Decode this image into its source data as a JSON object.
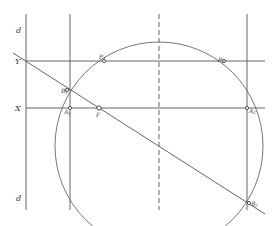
{
  "diagram": {
    "type": "geometric-construction",
    "labels": {
      "d_top": "d",
      "d_bottom": "d",
      "Y": "Y",
      "X": "X",
      "P1": "P",
      "P1_sub": "1",
      "P2": "P",
      "P2_sub": "2",
      "B1": "B",
      "B1_sub": "1",
      "A1": "A",
      "A1_sub": "1",
      "F": "F",
      "A2": "A",
      "A2_sub": "2",
      "B2": "B",
      "B2_sub": "2"
    },
    "elements": {
      "vertical_lines": [
        {
          "name": "d-line",
          "x": 26,
          "y1": 14,
          "y2": 210
        },
        {
          "name": "a1-line",
          "x": 70,
          "y1": 14,
          "y2": 210
        },
        {
          "name": "axis-dashed",
          "x": 159,
          "y1": 14,
          "y2": 210,
          "dashed": true
        },
        {
          "name": "a2-line",
          "x": 247,
          "y1": 14,
          "y2": 210
        }
      ],
      "horizontal_lines": [
        {
          "name": "y-line",
          "y": 61,
          "x1": 26,
          "x2": 265
        },
        {
          "name": "x-line",
          "y": 108,
          "x1": 26,
          "x2": 265
        }
      ],
      "diagonal": {
        "x1": 13,
        "y1": 53,
        "x2": 265,
        "y2": 214
      },
      "circle": {
        "cx": 159,
        "cy": 146,
        "r": 104
      },
      "points": [
        {
          "name": "P1",
          "x": 104,
          "y": 61
        },
        {
          "name": "P2",
          "x": 224,
          "y": 61
        },
        {
          "name": "B1",
          "x": 67,
          "y": 90
        },
        {
          "name": "A1",
          "x": 70,
          "y": 108
        },
        {
          "name": "F",
          "x": 99,
          "y": 108
        },
        {
          "name": "A2",
          "x": 247,
          "y": 108
        },
        {
          "name": "B2",
          "x": 249,
          "y": 203
        }
      ]
    },
    "colors": {
      "background": "#ffffff",
      "stroke": "#555555",
      "text": "#333333"
    }
  }
}
